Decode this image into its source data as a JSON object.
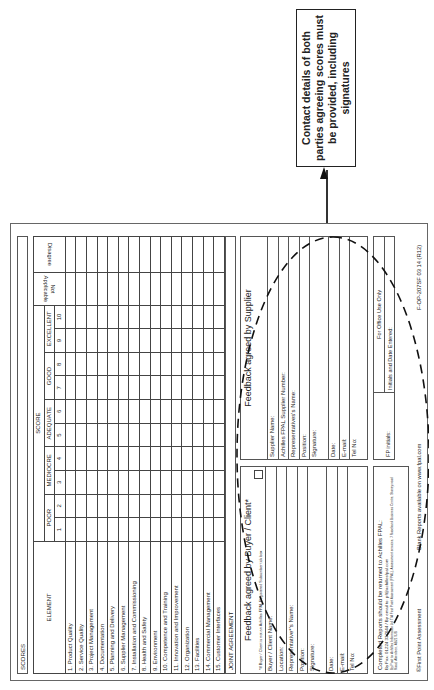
{
  "callout": {
    "text": "Contact details of both parties agreeing scores must be provided, including signatures"
  },
  "form": {
    "scores_label": "SCORES",
    "table": {
      "element_header": "ELEMENT",
      "score_header": "SCORE",
      "bands": [
        {
          "label": "POOR",
          "columns": [
            "1",
            "2"
          ]
        },
        {
          "label": "MEDIOCRE",
          "columns": [
            "3",
            "4"
          ]
        },
        {
          "label": "ADEQUATE",
          "columns": [
            "5",
            "6"
          ]
        },
        {
          "label": "GOOD",
          "columns": [
            "7",
            "8"
          ]
        },
        {
          "label": "EXCELLENT",
          "columns": [
            "9",
            "10"
          ]
        }
      ],
      "not_applicable_header": "Not Applicable",
      "disagree_header": "Disagree",
      "elements": [
        "1.  Product Quality",
        "2.  Service Quality",
        "3.  Project Management",
        "4.  Documentation",
        "5.  Planning and Delivery",
        "6.  Supplier Management",
        "7.  Installation and Commissioning",
        "8.  Health and Safety",
        "9.  Environment",
        "10.  Competence and Training",
        "11.  Innovation and Improvement",
        "12.  Organization",
        "13.  Facilities",
        "14.  Commercial Management",
        "15.  Customer Interfaces"
      ]
    },
    "joint_agreement_label": "JOINT AGREEMENT",
    "buyer_feedback": {
      "title": "Feedback agreed by Buyer / Client*",
      "note": "*If Buyer / Client is not an Achilles FPAL Registered Subscriber tick box",
      "fields": [
        "Buyer / Client Name:",
        "Location:",
        "Representative*'s Name:",
        "Position:",
        "Signature:",
        "Date:",
        "E-mail:",
        "Tel No:"
      ]
    },
    "supplier_feedback": {
      "title": "Feedback agreed by Supplier",
      "fields": [
        "Supplier Name:",
        "Achilles FPAL Supplier Number:",
        "Representatives's Name:",
        "Position:",
        "Signature:",
        "Date:",
        "E-mail:",
        "Tel No:"
      ]
    },
    "completed_reports": {
      "line1": "Completed Reports should be returned to Achilles FPAL:",
      "line2": "By Fax: 01224 337644 / By email to: pf@achillesfpal.com",
      "line3": "By Post to: Achilles Information Ltd T/A First Point Assessment (FPAL), Assessment services, 7 Rosebank Business Centre, Stoneywood Road, Aberdeen, AB21 9JS"
    },
    "office_use": {
      "fp_initials_label": "FP initials:",
      "header": "For Office Use Only",
      "initials_date_label": "Initials and Date Entered:"
    },
    "footer": {
      "left": "©First Point Assessment",
      "middle": "Blank Reports available on www.fpal.com",
      "right": "F-OP-207SF 03 14 (R12)"
    }
  }
}
